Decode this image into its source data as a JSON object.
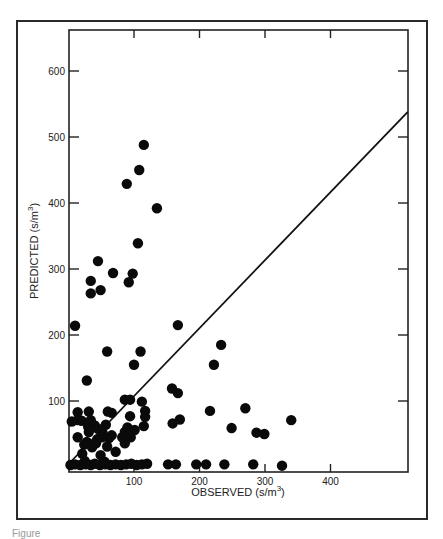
{
  "chart_data": {
    "type": "scatter",
    "title": "",
    "xlabel": "OBSERVED (s/m3)",
    "ylabel": "PREDICTED (s/m3)",
    "xlabel_display": {
      "main": "OBSERVED (s/m",
      "sup": "3",
      "close": ")"
    },
    "ylabel_display": {
      "main": "PREDICTED (s/m",
      "sup": "3",
      "close": ")"
    },
    "xlim": [
      0,
      518
    ],
    "ylim": [
      0,
      660
    ],
    "x_ticks": [
      100,
      200,
      300,
      400
    ],
    "y_ticks": [
      100,
      200,
      300,
      400,
      500,
      600
    ],
    "grid": false,
    "legend": null,
    "regression_line": {
      "x": [
        0,
        518
      ],
      "y": [
        0,
        538
      ]
    },
    "points": [
      {
        "x": 115,
        "y": 488
      },
      {
        "x": 108,
        "y": 450
      },
      {
        "x": 89,
        "y": 429
      },
      {
        "x": 135,
        "y": 392
      },
      {
        "x": 106,
        "y": 339
      },
      {
        "x": 45,
        "y": 312
      },
      {
        "x": 68,
        "y": 294
      },
      {
        "x": 98,
        "y": 293
      },
      {
        "x": 34,
        "y": 282
      },
      {
        "x": 92,
        "y": 280
      },
      {
        "x": 49,
        "y": 268
      },
      {
        "x": 34,
        "y": 263
      },
      {
        "x": 10,
        "y": 214
      },
      {
        "x": 167,
        "y": 215
      },
      {
        "x": 59,
        "y": 175
      },
      {
        "x": 110,
        "y": 175
      },
      {
        "x": 100,
        "y": 155
      },
      {
        "x": 28,
        "y": 131
      },
      {
        "x": 233,
        "y": 185
      },
      {
        "x": 222,
        "y": 155
      },
      {
        "x": 158,
        "y": 119
      },
      {
        "x": 167,
        "y": 112
      },
      {
        "x": 216,
        "y": 85
      },
      {
        "x": 270,
        "y": 89
      },
      {
        "x": 340,
        "y": 71
      },
      {
        "x": 249,
        "y": 59
      },
      {
        "x": 287,
        "y": 52
      },
      {
        "x": 299,
        "y": 50
      },
      {
        "x": 159,
        "y": 66
      },
      {
        "x": 170,
        "y": 72
      },
      {
        "x": 86,
        "y": 102
      },
      {
        "x": 94,
        "y": 102
      },
      {
        "x": 112,
        "y": 99
      },
      {
        "x": 117,
        "y": 85
      },
      {
        "x": 117,
        "y": 76
      },
      {
        "x": 115,
        "y": 62
      },
      {
        "x": 60,
        "y": 84
      },
      {
        "x": 66,
        "y": 82
      },
      {
        "x": 94,
        "y": 77
      },
      {
        "x": 90,
        "y": 60
      },
      {
        "x": 101,
        "y": 56
      },
      {
        "x": 86,
        "y": 53
      },
      {
        "x": 82,
        "y": 45
      },
      {
        "x": 95,
        "y": 45
      },
      {
        "x": 86,
        "y": 36
      },
      {
        "x": 14,
        "y": 83
      },
      {
        "x": 31,
        "y": 84
      },
      {
        "x": 5,
        "y": 69
      },
      {
        "x": 14,
        "y": 71
      },
      {
        "x": 20,
        "y": 70
      },
      {
        "x": 30,
        "y": 61
      },
      {
        "x": 34,
        "y": 71
      },
      {
        "x": 40,
        "y": 63
      },
      {
        "x": 57,
        "y": 64
      },
      {
        "x": 45,
        "y": 58
      },
      {
        "x": 52,
        "y": 52
      },
      {
        "x": 62,
        "y": 44
      },
      {
        "x": 14,
        "y": 45
      },
      {
        "x": 24,
        "y": 34
      },
      {
        "x": 31,
        "y": 53
      },
      {
        "x": 42,
        "y": 36
      },
      {
        "x": 51,
        "y": 45
      },
      {
        "x": 59,
        "y": 31
      },
      {
        "x": 66,
        "y": 48
      },
      {
        "x": 72,
        "y": 23
      },
      {
        "x": 21,
        "y": 20
      },
      {
        "x": 49,
        "y": 18
      },
      {
        "x": 55,
        "y": 8
      },
      {
        "x": 25,
        "y": 9
      },
      {
        "x": 28,
        "y": 38
      },
      {
        "x": 36,
        "y": 30
      },
      {
        "x": 44,
        "y": 42
      },
      {
        "x": 3,
        "y": 3
      },
      {
        "x": 10,
        "y": 4
      },
      {
        "x": 18,
        "y": 3
      },
      {
        "x": 26,
        "y": 4
      },
      {
        "x": 34,
        "y": 3
      },
      {
        "x": 40,
        "y": 5
      },
      {
        "x": 48,
        "y": 3
      },
      {
        "x": 56,
        "y": 4
      },
      {
        "x": 64,
        "y": 3
      },
      {
        "x": 72,
        "y": 4
      },
      {
        "x": 80,
        "y": 3
      },
      {
        "x": 88,
        "y": 4
      },
      {
        "x": 96,
        "y": 5
      },
      {
        "x": 104,
        "y": 3
      },
      {
        "x": 112,
        "y": 4
      },
      {
        "x": 120,
        "y": 5
      },
      {
        "x": 152,
        "y": 4
      },
      {
        "x": 164,
        "y": 4
      },
      {
        "x": 195,
        "y": 4
      },
      {
        "x": 210,
        "y": 4
      },
      {
        "x": 238,
        "y": 4
      },
      {
        "x": 282,
        "y": 4
      },
      {
        "x": 326,
        "y": 2
      }
    ]
  },
  "figure": {
    "caption": "Figure"
  }
}
